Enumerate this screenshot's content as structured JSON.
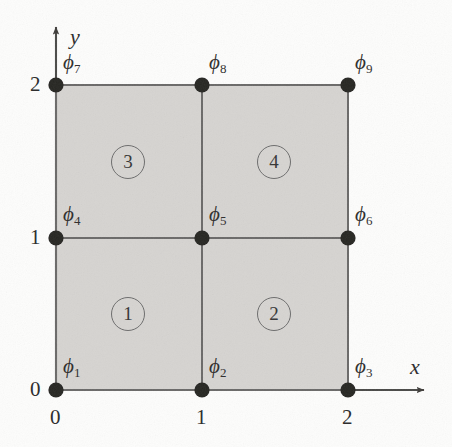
{
  "figure": {
    "type": "finite-element-mesh"
  },
  "axes": {
    "x_label": "x",
    "y_label": "y",
    "x_ticks": [
      "0",
      "1",
      "2"
    ],
    "y_ticks": [
      "0",
      "1",
      "2"
    ],
    "origin_label": "0"
  },
  "nodes": [
    {
      "id": "phi1",
      "symbol": "ϕ",
      "sub": "1",
      "x": 0,
      "y": 0
    },
    {
      "id": "phi2",
      "symbol": "ϕ",
      "sub": "2",
      "x": 1,
      "y": 0
    },
    {
      "id": "phi3",
      "symbol": "ϕ",
      "sub": "3",
      "x": 2,
      "y": 0
    },
    {
      "id": "phi4",
      "symbol": "ϕ",
      "sub": "4",
      "x": 0,
      "y": 1
    },
    {
      "id": "phi5",
      "symbol": "ϕ",
      "sub": "5",
      "x": 1,
      "y": 1
    },
    {
      "id": "phi6",
      "symbol": "ϕ",
      "sub": "6",
      "x": 2,
      "y": 1
    },
    {
      "id": "phi7",
      "symbol": "ϕ",
      "sub": "7",
      "x": 0,
      "y": 2
    },
    {
      "id": "phi8",
      "symbol": "ϕ",
      "sub": "8",
      "x": 1,
      "y": 2
    },
    {
      "id": "phi9",
      "symbol": "ϕ",
      "sub": "9",
      "x": 2,
      "y": 2
    }
  ],
  "elements": [
    {
      "id": "element1",
      "label": "1",
      "cx": 0.5,
      "cy": 0.5
    },
    {
      "id": "element2",
      "label": "2",
      "cx": 1.5,
      "cy": 0.5
    },
    {
      "id": "element3",
      "label": "3",
      "cx": 0.5,
      "cy": 1.5
    },
    {
      "id": "element4",
      "label": "4",
      "cx": 1.5,
      "cy": 1.5
    }
  ],
  "colors": {
    "domain_fill": "#d6d4d1",
    "grid_line": "#6b6967",
    "node_dot": "#262524",
    "axis_line": "#4a4846",
    "text": "#2e2e2e",
    "background": "#fdfdfc"
  }
}
